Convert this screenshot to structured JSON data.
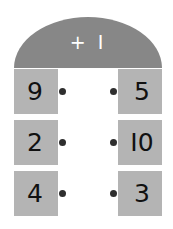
{
  "card": {
    "header": {
      "label": "+ I",
      "operation_text": "+1",
      "background_color": "#878787",
      "text_color": "#ffffff"
    },
    "tile_color": "#b4b4b4",
    "dot_color": "#2e2e2e",
    "page_background": "#ffffff",
    "rows": [
      {
        "left": "9",
        "right": "5"
      },
      {
        "left": "2",
        "right": "I0"
      },
      {
        "left": "4",
        "right": "3"
      }
    ]
  }
}
